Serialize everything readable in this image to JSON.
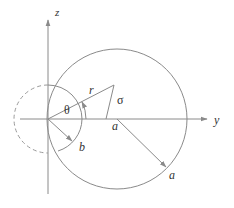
{
  "diagram": {
    "axes": {
      "z_label": "z",
      "y_label": "y"
    },
    "labels": {
      "r": "r",
      "theta": "θ",
      "sigma": "σ",
      "a_center": "a",
      "a_radius": "a",
      "b_radius": "b"
    },
    "colors": {
      "line": "#8a8a8a",
      "text": "#333333",
      "background": "#ffffff"
    }
  }
}
